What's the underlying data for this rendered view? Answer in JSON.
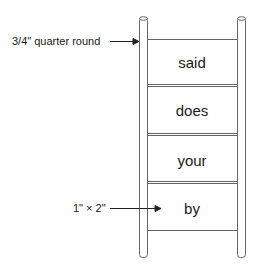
{
  "diagram": {
    "type": "ladder",
    "stroke_color": "#555555",
    "annotations": [
      {
        "id": "quarter-round",
        "text": "3/4\" quarter round",
        "points_to": "left-rail"
      },
      {
        "id": "rung-size",
        "text": "1\" × 2\"",
        "points_to": "rung-section"
      }
    ],
    "rungs": [
      {
        "label": "said"
      },
      {
        "label": "does"
      },
      {
        "label": "your"
      },
      {
        "label": "by"
      }
    ]
  }
}
